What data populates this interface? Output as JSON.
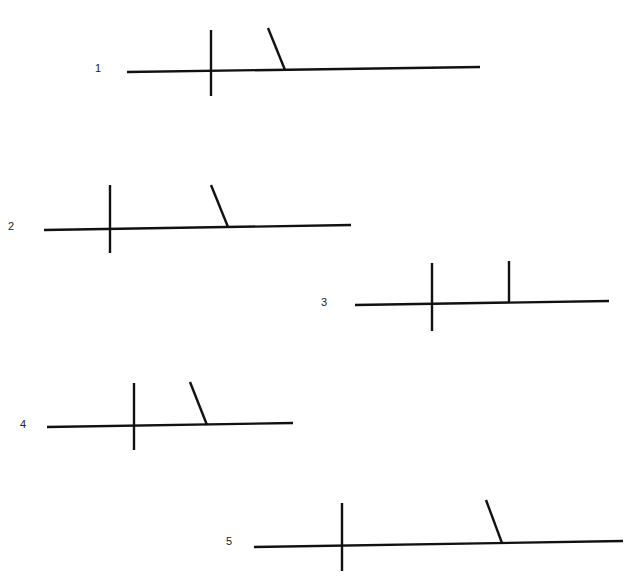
{
  "diagrams": [
    {
      "number": "1",
      "label_pos": [
        95,
        63
      ],
      "baseline": [
        127,
        72,
        480,
        67
      ],
      "divider": [
        211,
        30,
        211,
        96
      ],
      "branch": {
        "type": "slant",
        "coords": [
          268,
          28,
          285,
          70
        ]
      }
    },
    {
      "number": "2",
      "label_pos": [
        8,
        221
      ],
      "baseline": [
        44,
        230,
        351,
        225
      ],
      "divider": [
        110,
        185,
        110,
        253
      ],
      "branch": {
        "type": "slant",
        "coords": [
          211,
          185,
          228,
          227
        ]
      }
    },
    {
      "number": "3",
      "label_pos": [
        321,
        297
      ],
      "baseline": [
        355,
        305,
        609,
        301
      ],
      "divider": [
        432,
        263,
        432,
        331
      ],
      "branch": {
        "type": "vertical",
        "coords": [
          509,
          261,
          509,
          303
        ]
      }
    },
    {
      "number": "4",
      "label_pos": [
        20,
        419
      ],
      "baseline": [
        47,
        427,
        293,
        423
      ],
      "divider": [
        134,
        383,
        134,
        450
      ],
      "branch": {
        "type": "slant",
        "coords": [
          190,
          382,
          207,
          425
        ]
      }
    },
    {
      "number": "5",
      "label_pos": [
        226,
        536
      ],
      "baseline": [
        254,
        547,
        623,
        541
      ],
      "divider": [
        342,
        503,
        342,
        571
      ],
      "branch": {
        "type": "slant",
        "coords": [
          486,
          500,
          502,
          543
        ]
      }
    }
  ],
  "colors": {
    "background": "#ffffff",
    "line": "#111111",
    "label": "#222222"
  }
}
